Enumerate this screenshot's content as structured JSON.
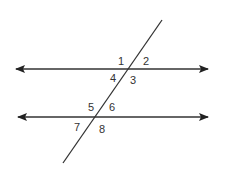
{
  "diagram": {
    "line_color": "#333333",
    "angle_labels": [
      {
        "label": "1",
        "x": 118,
        "y": 65
      },
      {
        "label": "2",
        "x": 143,
        "y": 65
      },
      {
        "label": "4",
        "x": 110,
        "y": 82
      },
      {
        "label": "3",
        "x": 130,
        "y": 84
      },
      {
        "label": "5",
        "x": 88,
        "y": 111
      },
      {
        "label": "6",
        "x": 109,
        "y": 111
      },
      {
        "label": "7",
        "x": 74,
        "y": 131
      },
      {
        "label": "8",
        "x": 99,
        "y": 133
      }
    ]
  }
}
